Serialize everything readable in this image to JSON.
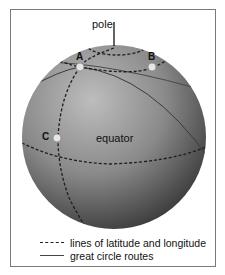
{
  "labels": {
    "pole": "pole",
    "equator": "equator",
    "point_a": "A",
    "point_b": "B",
    "point_c": "C"
  },
  "legend": [
    {
      "style": "dashed",
      "label": "lines of latitude and longitude"
    },
    {
      "style": "solid",
      "label": "great circle routes"
    }
  ],
  "colors": {
    "globe_light": "#b8b8b8",
    "globe_dark": "#3a3a3a",
    "point_fill": "#e6e6e6",
    "line": "#1e1e1e"
  }
}
